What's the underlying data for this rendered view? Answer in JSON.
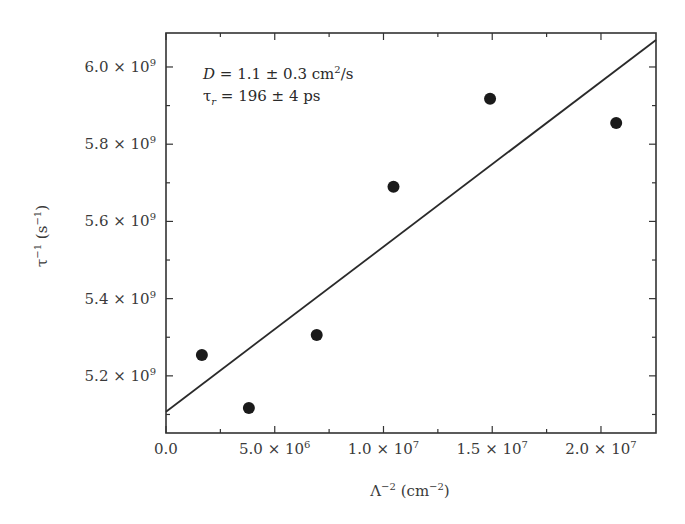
{
  "chart_data": {
    "type": "scatter",
    "title": "",
    "xlabel": "Λ⁻² (cm⁻²)",
    "ylabel": "τ⁻¹ (s⁻¹)",
    "xlim": [
      0,
      22530000
    ],
    "ylim": [
      5052000000,
      6088000000
    ],
    "grid": false,
    "legend": null,
    "x_ticks": [
      {
        "value": 0,
        "label": "0.0"
      },
      {
        "value": 5000000,
        "label": "5.0 × 10",
        "exp": "6"
      },
      {
        "value": 10000000,
        "label": "1.0 × 10",
        "exp": "7"
      },
      {
        "value": 15000000,
        "label": "1.5 × 10",
        "exp": "7"
      },
      {
        "value": 20000000,
        "label": "2.0 × 10",
        "exp": "7"
      }
    ],
    "x_minor_ticks": [
      2500000,
      7500000,
      12500000,
      17500000
    ],
    "y_ticks": [
      {
        "value": 5200000000,
        "label": "5.2 × 10",
        "exp": "9"
      },
      {
        "value": 5400000000,
        "label": "5.4 × 10",
        "exp": "9"
      },
      {
        "value": 5600000000,
        "label": "5.6 × 10",
        "exp": "9"
      },
      {
        "value": 5800000000,
        "label": "5.8 × 10",
        "exp": "9"
      },
      {
        "value": 6000000000,
        "label": "6.0 × 10",
        "exp": "9"
      }
    ],
    "y_minor_ticks": [
      5100000000,
      5300000000,
      5500000000,
      5700000000,
      5900000000
    ],
    "series": [
      {
        "name": "data",
        "type": "scatter",
        "marker": "filled-circle",
        "color": "#1a1a1a",
        "x": [
          1650000,
          3810000,
          6930000,
          10460000,
          14900000,
          20700000
        ],
        "y": [
          5254000000,
          5117000000,
          5306000000,
          5690000000,
          5918000000,
          5855000000
        ]
      },
      {
        "name": "linear fit",
        "type": "line",
        "color": "#2a2a2a",
        "x": [
          0,
          22530000
        ],
        "y": [
          5107000000,
          6070000000
        ]
      }
    ],
    "annotations": [
      {
        "text": "D = 1.1 ± 0.3 cm²/s",
        "position": "upper-left"
      },
      {
        "text": "τr = 196 ± 4 ps",
        "position": "upper-left"
      }
    ]
  },
  "annotations": {
    "line1": {
      "var": "D",
      "rest": " = 1.1 ± 0.3 cm",
      "sup": "2",
      "tail": "/s"
    },
    "line2": {
      "var": "τ",
      "sub": "r",
      "rest": " = 196 ± 4 ps"
    }
  },
  "axes": {
    "xlabel": {
      "main": "Λ",
      "sup1": "−2",
      "mid": " (cm",
      "sup2": "−2",
      "end": ")"
    },
    "ylabel": {
      "main": "τ",
      "sup1": "−1",
      "mid": " (s",
      "sup2": "−1",
      "end": ")"
    }
  }
}
